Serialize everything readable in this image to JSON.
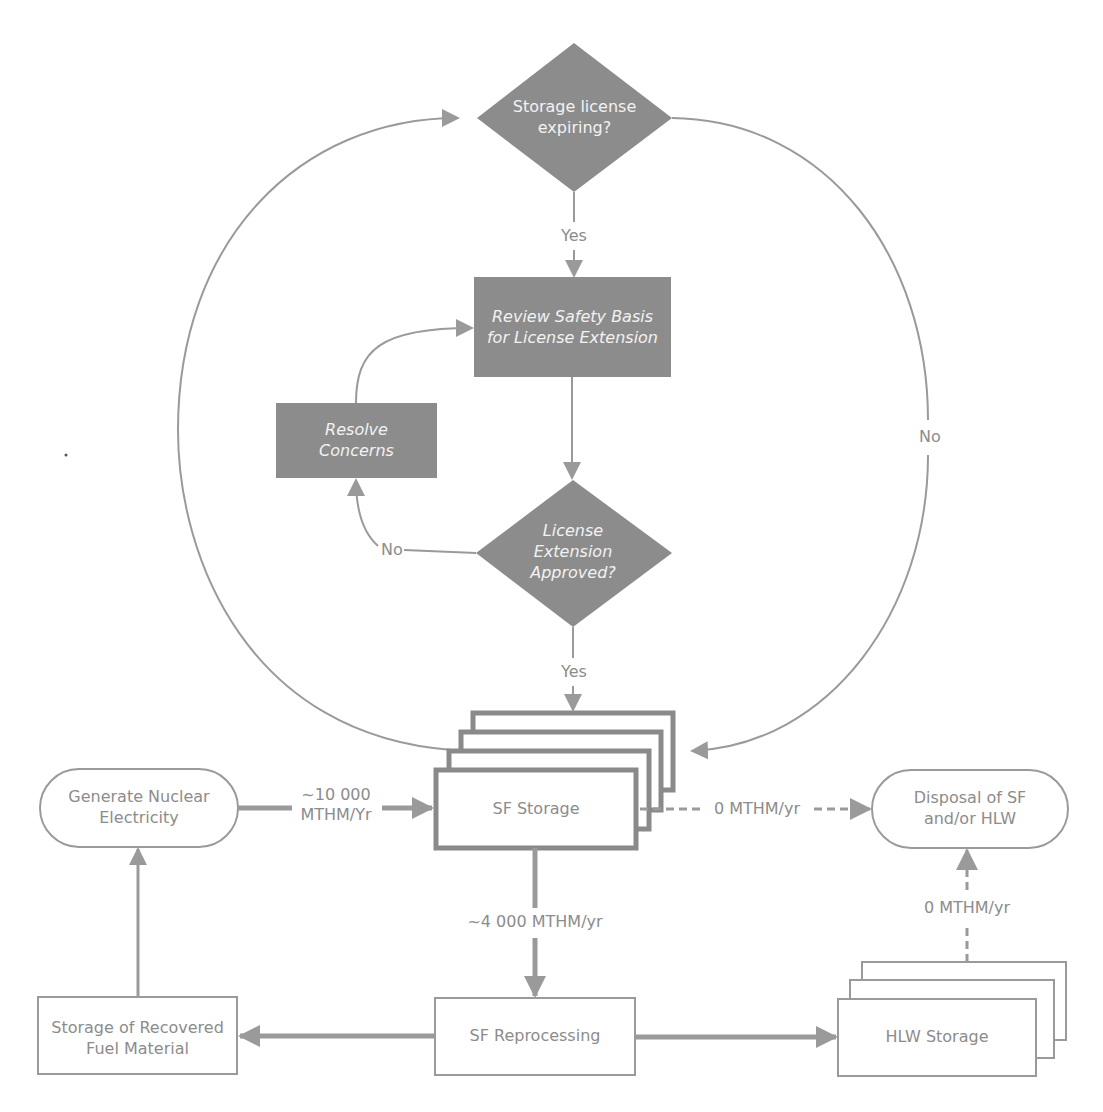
{
  "diagram": {
    "colors": {
      "dark_fill": "#8c8c8c",
      "line": "#9a9a9a",
      "thick_border": "#8a8a8a",
      "text_light": "#8c8c8c",
      "text_on_dark": "#f2f2f2",
      "background": "#ffffff"
    },
    "nodes": {
      "storage_license_expiring": {
        "type": "decision",
        "text": "Storage license expiring?"
      },
      "review_safety_basis": {
        "type": "process",
        "text": "Review Safety Basis for License Extension"
      },
      "resolve_concerns": {
        "type": "process",
        "text": "Resolve Concerns"
      },
      "license_extension_approved": {
        "type": "decision",
        "text": "License Extension Approved?"
      },
      "sf_storage": {
        "type": "stacked-process",
        "text": "SF Storage"
      },
      "generate_nuclear_electricity": {
        "type": "terminator",
        "text": "Generate Nuclear Electricity"
      },
      "disposal": {
        "type": "terminator",
        "text": "Disposal of SF and/or HLW"
      },
      "sf_reprocessing": {
        "type": "process",
        "text": "SF Reprocessing"
      },
      "storage_recovered_fuel": {
        "type": "process",
        "text": "Storage of Recovered Fuel Material"
      },
      "hlw_storage": {
        "type": "stacked-process",
        "text": "HLW Storage"
      }
    },
    "edge_labels": {
      "expiring_yes": "Yes",
      "expiring_no": "No",
      "approved_no": "No",
      "approved_yes": "Yes",
      "generate_to_storage_line1": "~10 000",
      "generate_to_storage_line2": "MTHM/Yr",
      "storage_to_disposal": "0 MTHM/yr",
      "storage_to_reprocessing": "~4 000 MTHM/yr",
      "hlw_to_disposal": "0 MTHM/yr"
    },
    "edges": [
      {
        "from": "storage_license_expiring",
        "to": "review_safety_basis",
        "label": "Yes"
      },
      {
        "from": "storage_license_expiring",
        "to": "sf_storage",
        "label": "No"
      },
      {
        "from": "review_safety_basis",
        "to": "license_extension_approved"
      },
      {
        "from": "license_extension_approved",
        "to": "resolve_concerns",
        "label": "No"
      },
      {
        "from": "resolve_concerns",
        "to": "review_safety_basis"
      },
      {
        "from": "license_extension_approved",
        "to": "sf_storage",
        "label": "Yes"
      },
      {
        "from": "sf_storage",
        "to": "storage_license_expiring"
      },
      {
        "from": "generate_nuclear_electricity",
        "to": "sf_storage",
        "label": "~10 000 MTHM/Yr"
      },
      {
        "from": "sf_storage",
        "to": "disposal",
        "label": "0 MTHM/yr",
        "style": "dashed"
      },
      {
        "from": "sf_storage",
        "to": "sf_reprocessing",
        "label": "~4 000 MTHM/yr"
      },
      {
        "from": "sf_reprocessing",
        "to": "storage_recovered_fuel"
      },
      {
        "from": "sf_reprocessing",
        "to": "hlw_storage"
      },
      {
        "from": "storage_recovered_fuel",
        "to": "generate_nuclear_electricity"
      },
      {
        "from": "hlw_storage",
        "to": "disposal",
        "label": "0 MTHM/yr",
        "style": "dashed"
      }
    ]
  }
}
